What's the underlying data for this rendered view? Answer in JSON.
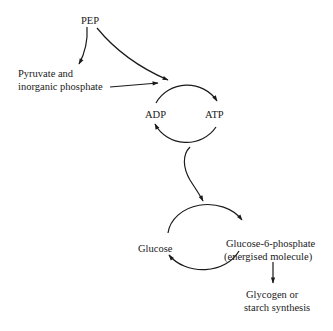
{
  "diagram": {
    "nodes": {
      "pep": "PEP",
      "pyruvate_line1": "Pyruvate and",
      "pyruvate_line2": "inorganic phosphate",
      "adp": "ADP",
      "atp": "ATP",
      "glucose": "Glucose",
      "g6p_line1": "Glucose-6-phosphate",
      "g6p_line2": "(energised molecule)",
      "glycogen_line1": "Glycogen or",
      "glycogen_line2": "starch synthesis"
    },
    "edges": [
      {
        "from": "PEP",
        "to": "Pyruvate and inorganic phosphate"
      },
      {
        "from": "PEP",
        "to": "ADP/ATP cycle"
      },
      {
        "from": "Pyruvate and inorganic phosphate",
        "to": "ADP/ATP cycle"
      },
      {
        "from": "ADP",
        "to": "ATP"
      },
      {
        "from": "ATP",
        "to": "ADP"
      },
      {
        "from": "ADP/ATP cycle",
        "to": "Glucose/Glucose-6-phosphate cycle"
      },
      {
        "from": "Glucose",
        "to": "Glucose-6-phosphate"
      },
      {
        "from": "Glucose-6-phosphate",
        "to": "Glucose"
      },
      {
        "from": "Glucose-6-phosphate",
        "to": "Glycogen or starch synthesis"
      }
    ],
    "colors": {
      "ink": "#1a1a1a",
      "background": "#ffffff"
    }
  }
}
